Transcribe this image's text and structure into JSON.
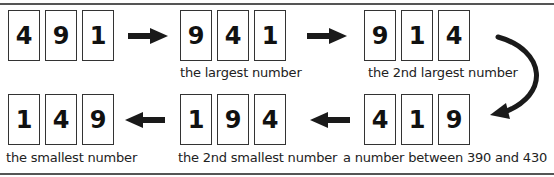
{
  "row1": [
    {
      "digits": [
        "4",
        "9",
        "1"
      ],
      "label": ""
    },
    {
      "digits": [
        "9",
        "4",
        "1"
      ],
      "label": "the largest number"
    },
    {
      "digits": [
        "9",
        "1",
        "4"
      ],
      "label": "the 2nd largest number"
    }
  ],
  "row2": [
    {
      "digits": [
        "1",
        "4",
        "9"
      ],
      "label": "the smallest number"
    },
    {
      "digits": [
        "1",
        "9",
        "4"
      ],
      "label": "the 2nd smallest number"
    },
    {
      "digits": [
        "4",
        "1",
        "9"
      ],
      "label": "a number between 390 and 430"
    }
  ],
  "arrows": [
    {
      "from": "491",
      "to": "941",
      "direction": "right"
    },
    {
      "from": "941",
      "to": "914",
      "direction": "right"
    },
    {
      "from": "914",
      "to": "419",
      "direction": "curved-down"
    },
    {
      "from": "419",
      "to": "194",
      "direction": "left"
    },
    {
      "from": "194",
      "to": "149",
      "direction": "left"
    }
  ],
  "colors": {
    "stroke": "#333333",
    "arrow": "#1a1a1a",
    "text": "#222222"
  }
}
